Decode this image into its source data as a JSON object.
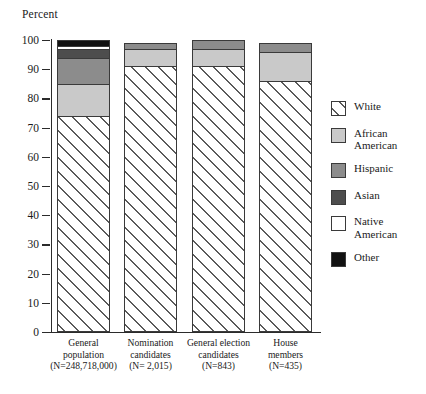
{
  "chart_data": {
    "type": "bar",
    "subtype": "stacked-bar-100",
    "title": "",
    "ylabel": "Percent",
    "xlabel": "",
    "ylim": [
      0,
      100
    ],
    "yticks": [
      0,
      10,
      20,
      30,
      40,
      50,
      60,
      70,
      80,
      90,
      100
    ],
    "grid": false,
    "legend_position": "right",
    "categories": [
      "General population",
      "Nomination candidates",
      "General election candidates",
      "House members"
    ],
    "category_labels": [
      [
        "General",
        "population",
        "(N=248,718,000)"
      ],
      [
        "Nomination",
        "candidates",
        "(N= 2,015)"
      ],
      [
        "General election",
        "candidates",
        "(N=843)"
      ],
      [
        "House",
        "members",
        "(N=435)"
      ]
    ],
    "category_n": [
      "248,718,000",
      "2,015",
      "843",
      "435"
    ],
    "series": [
      {
        "name": "White",
        "key": "white",
        "values": [
          74,
          91,
          91,
          86
        ]
      },
      {
        "name": "African American",
        "key": "africanamerican",
        "values": [
          11,
          6,
          6,
          10
        ]
      },
      {
        "name": "Hispanic",
        "key": "hispanic",
        "values": [
          9,
          2,
          3,
          3
        ]
      },
      {
        "name": "Asian",
        "key": "asian",
        "values": [
          3,
          0,
          0,
          0
        ]
      },
      {
        "name": "Native American",
        "key": "nativeamerican",
        "values": [
          1,
          0,
          0,
          0
        ]
      },
      {
        "name": "Other",
        "key": "other",
        "values": [
          2,
          0,
          0,
          0
        ]
      }
    ],
    "cumulative_tops": [
      [
        74,
        85,
        94,
        97,
        98,
        100
      ],
      [
        91,
        97,
        99,
        99,
        99,
        99
      ],
      [
        91,
        97,
        100,
        100,
        100,
        100
      ],
      [
        86,
        96,
        99,
        99,
        99,
        99
      ]
    ]
  },
  "legend": {
    "items": [
      {
        "label": "White",
        "key": "white",
        "swatch": "diagonal-hatch",
        "color": "#ffffff"
      },
      {
        "label": "African\nAmerican",
        "key": "africanamerican",
        "swatch": "solid",
        "color": "#c9c9c9"
      },
      {
        "label": "Hispanic",
        "key": "hispanic",
        "swatch": "solid",
        "color": "#8c8c8c"
      },
      {
        "label": "Asian",
        "key": "asian",
        "swatch": "solid",
        "color": "#4d4d4d"
      },
      {
        "label": "Native\nAmerican",
        "key": "nativeamerican",
        "swatch": "solid",
        "color": "#ffffff"
      },
      {
        "label": "Other",
        "key": "other",
        "swatch": "solid",
        "color": "#111111"
      }
    ]
  }
}
